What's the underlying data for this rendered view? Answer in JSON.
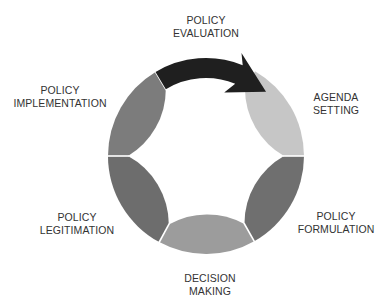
{
  "stages": [
    {
      "id": "agenda-setting",
      "line1": "AGENDA",
      "line2": "SETTING",
      "color": "#c6c6c6"
    },
    {
      "id": "policy-formulation",
      "line1": "POLICY",
      "line2": "FORMULATION",
      "color": "#6f6f6f"
    },
    {
      "id": "decision-making",
      "line1": "DECISION",
      "line2": "MAKING",
      "color": "#9c9c9c"
    },
    {
      "id": "policy-legitimation",
      "line1": "POLICY",
      "line2": "LEGITIMATION",
      "color": "#6d6d6d"
    },
    {
      "id": "policy-implementation",
      "line1": "POLICY",
      "line2": "IMPLEMENTATION",
      "color": "#7c7c7c"
    },
    {
      "id": "policy-evaluation",
      "line1": "POLICY",
      "line2": "EVALUATION",
      "color": "#1f1f1f",
      "is_arrow": true
    }
  ],
  "background_color": "#ffffff",
  "divider_color": "#ffffff"
}
